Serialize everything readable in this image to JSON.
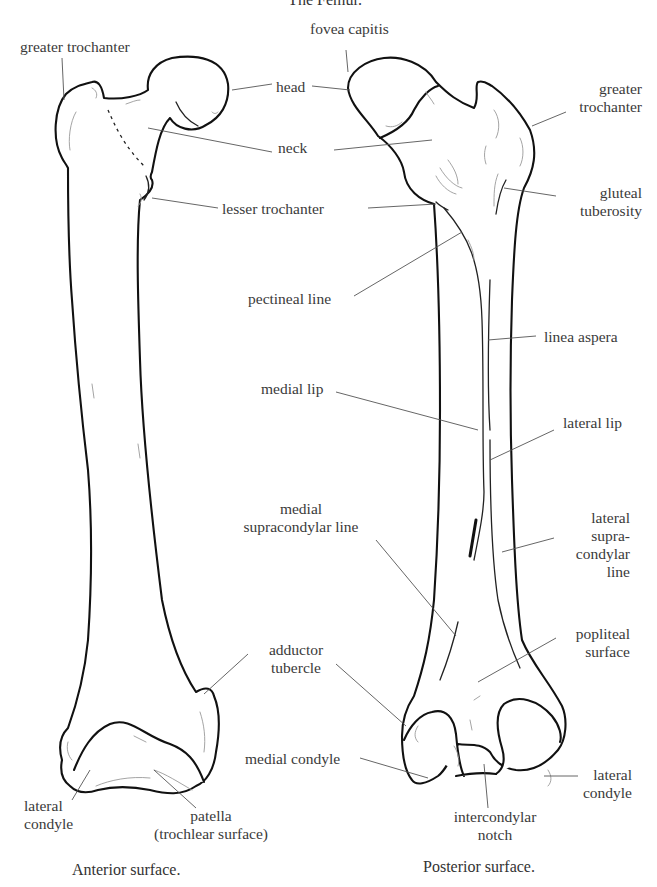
{
  "title": "The Femur.",
  "views": [
    {
      "name": "anterior",
      "caption": "Anterior surface.",
      "labels": {
        "greater_trochanter": "greater trochanter",
        "lateral_condyle_1": "lateral",
        "lateral_condyle_2": "condyle",
        "patella_1": "patella",
        "patella_2": "(trochlear surface)"
      }
    },
    {
      "name": "posterior",
      "caption": "Posterior surface.",
      "labels": {
        "fovea_capitis": "fovea capitis",
        "greater_trochanter_1": "greater",
        "greater_trochanter_2": "trochanter",
        "gluteal_tuberosity_1": "gluteal",
        "gluteal_tuberosity_2": "tuberosity",
        "pectineal_line": "pectineal line",
        "linea_aspera": "linea aspera",
        "medial_lip": "medial lip",
        "lateral_lip": "lateral lip",
        "medial_supracondylar_1": "medial",
        "medial_supracondylar_2": "supracondylar line",
        "lateral_supracondylar_1": "lateral",
        "lateral_supracondylar_2": "supra-",
        "lateral_supracondylar_3": "condylar",
        "lateral_supracondylar_4": "line",
        "popliteal_1": "popliteal",
        "popliteal_2": "surface",
        "medial_condyle": "medial condyle",
        "lateral_condyle_1": "lateral",
        "lateral_condyle_2": "condyle",
        "intercondylar_1": "intercondylar",
        "intercondylar_2": "notch"
      }
    }
  ],
  "shared_labels": {
    "head": "head",
    "neck": "neck",
    "lesser_trochanter": "lesser trochanter",
    "adductor_tubercle_1": "adductor",
    "adductor_tubercle_2": "tubercle"
  }
}
